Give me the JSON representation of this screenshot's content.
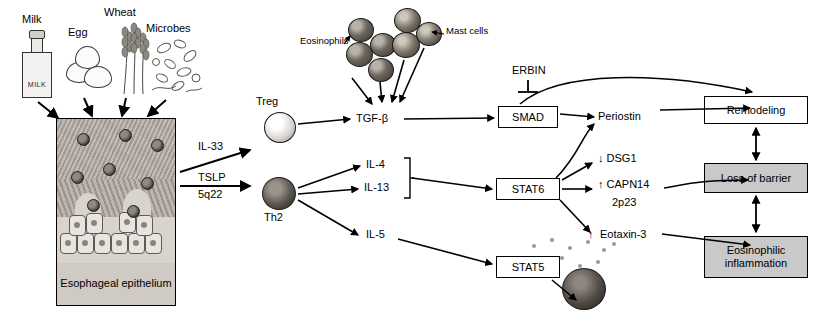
{
  "diagram": {
    "triggers": [
      {
        "name": "Milk",
        "label": "Milk",
        "icon": "milk-carton-icon",
        "carton_word": "MILK"
      },
      {
        "name": "Egg",
        "label": "Egg",
        "icon": "eggs-icon"
      },
      {
        "name": "Wheat",
        "label": "Wheat",
        "icon": "wheat-stalks-icon"
      },
      {
        "name": "Microbes",
        "label": "Microbes",
        "icon": "microbes-icon"
      }
    ],
    "tissue": {
      "caption": "Esophageal epithelium",
      "name": "esophageal-epithelium-illustration"
    },
    "cytokine_stack": {
      "lines": [
        "IL-33",
        "TSLP",
        "5q22"
      ]
    },
    "cells": [
      {
        "label": "Eosinophils",
        "name": "eosinophils-label"
      },
      {
        "label": "Mast cells",
        "name": "mast-cells-label"
      },
      {
        "label": "Treg",
        "name": "treg-label"
      },
      {
        "label": "Th2",
        "name": "th2-label"
      }
    ],
    "mediators": [
      {
        "label": "TGF-β",
        "name": "tgf-beta-label"
      },
      {
        "label": "IL-4",
        "name": "il4-label"
      },
      {
        "label": "IL-13",
        "name": "il13-label"
      },
      {
        "label": "IL-5",
        "name": "il5-label"
      },
      {
        "label": "ERBIN",
        "name": "erbin-label"
      },
      {
        "label": "Periostin",
        "name": "periostin-label"
      },
      {
        "label": "Eotaxin-3",
        "name": "eotaxin-3-label"
      }
    ],
    "signal_boxes": [
      {
        "label": "SMAD",
        "name": "smad-box"
      },
      {
        "label": "STAT6",
        "name": "stat6-box"
      },
      {
        "label": "STAT5",
        "name": "stat5-box"
      }
    ],
    "regulated": [
      {
        "arrow": "↓",
        "label": "DSG1",
        "name": "dsg1-item"
      },
      {
        "arrow": "↑",
        "label": "CAPN14",
        "sub": "2p23",
        "name": "capn14-item"
      }
    ],
    "outcomes": [
      {
        "label": "Remodeling",
        "shaded": false,
        "name": "remodeling-box"
      },
      {
        "label": "Loss of barrier",
        "shaded": true,
        "name": "loss-of-barrier-box"
      },
      {
        "label": "Eosinophilic inflammation",
        "shaded": true,
        "name": "eosinophilic-inflammation-box"
      }
    ],
    "arrow_up": "↑",
    "arrow_down": "↓",
    "colors": {
      "line": "#000000",
      "shaded_box": "#c9c9c9",
      "tissue_base": "#b9b2ab",
      "background": "#ffffff"
    }
  }
}
